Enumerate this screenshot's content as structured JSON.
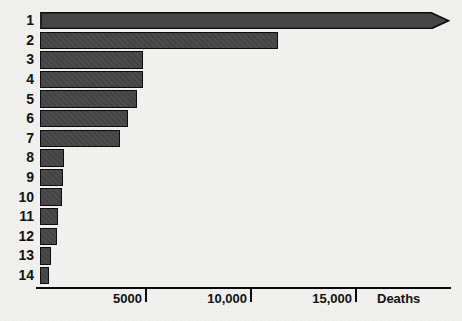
{
  "chart_data": {
    "type": "bar",
    "orientation": "horizontal",
    "title": "",
    "subtitle": "",
    "xlabel": "Deaths",
    "ylabel": "",
    "categories": [
      "1",
      "2",
      "3",
      "4",
      "5",
      "6",
      "7",
      "8",
      "9",
      "10",
      "11",
      "12",
      "13",
      "14"
    ],
    "values": [
      19500,
      11350,
      4900,
      4890,
      4600,
      4190,
      3810,
      1140,
      1110,
      1050,
      870,
      800,
      520,
      440
    ],
    "value_truncated": [
      true,
      false,
      false,
      false,
      false,
      false,
      false,
      false,
      false,
      false,
      false,
      false,
      false,
      false
    ],
    "xlim": [
      0,
      19300
    ],
    "xticks": [
      5000,
      10000,
      15000
    ],
    "xtick_labels": [
      "5000",
      "10,000",
      "15,000"
    ],
    "grid": false,
    "legend": null
  },
  "axis": {
    "x_title": "Deaths",
    "tick_labels": [
      "5000",
      "10,000",
      "15,000"
    ]
  },
  "series": {
    "bars": [
      {
        "label": "1",
        "value": 19500,
        "arrow": true
      },
      {
        "label": "2",
        "value": 11350,
        "arrow": false
      },
      {
        "label": "3",
        "value": 4900,
        "arrow": false
      },
      {
        "label": "4",
        "value": 4890,
        "arrow": false
      },
      {
        "label": "5",
        "value": 4600,
        "arrow": false
      },
      {
        "label": "6",
        "value": 4190,
        "arrow": false
      },
      {
        "label": "7",
        "value": 3810,
        "arrow": false
      },
      {
        "label": "8",
        "value": 1140,
        "arrow": false
      },
      {
        "label": "9",
        "value": 1110,
        "arrow": false
      },
      {
        "label": "10",
        "value": 1050,
        "arrow": false
      },
      {
        "label": "11",
        "value": 870,
        "arrow": false
      },
      {
        "label": "12",
        "value": 800,
        "arrow": false
      },
      {
        "label": "13",
        "value": 520,
        "arrow": false
      },
      {
        "label": "14",
        "value": 440,
        "arrow": false
      }
    ]
  },
  "colors": {
    "bar_fill": "#454545",
    "bar_stroke": "#0c0c0c",
    "axis": "#0b0b0b",
    "text": "#111111",
    "background": "#f1f1ef"
  },
  "geometry": {
    "origin_x": 40,
    "px_per_unit": 0.021,
    "bar_top": 12,
    "bar_height": 17.4,
    "bar_pitch": 19.6,
    "axis_y": 287,
    "label_font_px": 14,
    "tick_font_px": 13
  }
}
